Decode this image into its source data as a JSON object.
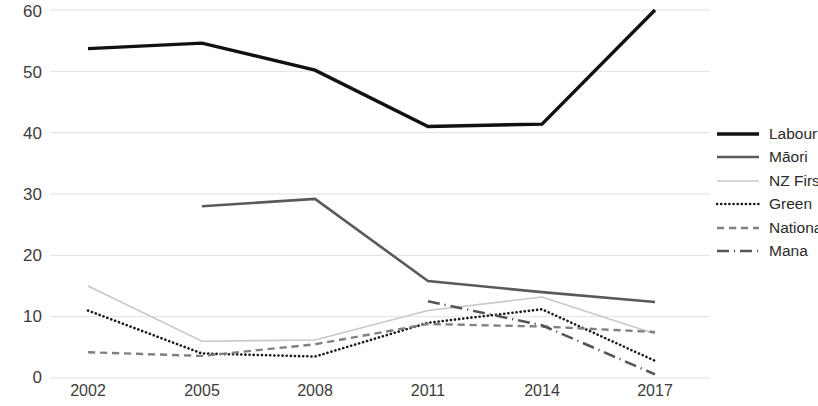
{
  "chart_data": {
    "type": "line",
    "title": "",
    "subtitle": "",
    "xlabel": "",
    "ylabel": "",
    "categories": [
      "2002",
      "2005",
      "2008",
      "2011",
      "2014",
      "2017"
    ],
    "x_tick_labels": [
      "2002",
      "2005",
      "2008",
      "2011",
      "2014",
      "2017"
    ],
    "y_tick_labels": [
      "0",
      "10",
      "20",
      "30",
      "40",
      "50",
      "60"
    ],
    "ylim": [
      0,
      60
    ],
    "xlim": [
      "2002",
      "2017"
    ],
    "grid": "horizontal",
    "legend_position": "right",
    "series": [
      {
        "name": "Labour",
        "style": "solid",
        "color": "#111111",
        "width": 3.4,
        "values": [
          53.7,
          54.6,
          50.2,
          41.0,
          41.4,
          60.0
        ]
      },
      {
        "name": "Māori",
        "style": "solid",
        "color": "#5a5a5a",
        "width": 2.6,
        "values": [
          null,
          28.0,
          29.2,
          15.8,
          14.0,
          12.4
        ]
      },
      {
        "name": "NZ First",
        "style": "solid",
        "color": "#c8c8c8",
        "width": 1.6,
        "values": [
          15.0,
          6.0,
          6.2,
          11.0,
          13.2,
          7.2
        ]
      },
      {
        "name": "Green",
        "style": "dotted",
        "color": "#1a1a1a",
        "width": 2.6,
        "values": [
          11.0,
          4.0,
          3.5,
          9.0,
          11.2,
          2.8
        ]
      },
      {
        "name": "National",
        "style": "dashed",
        "color": "#808080",
        "width": 2.4,
        "values": [
          4.2,
          3.6,
          5.5,
          8.8,
          8.4,
          7.5
        ]
      },
      {
        "name": "Mana",
        "style": "dashdot",
        "color": "#555555",
        "width": 2.6,
        "values": [
          null,
          null,
          null,
          12.5,
          8.6,
          0.6
        ]
      }
    ]
  },
  "legend": {
    "items": [
      {
        "label": "Labour",
        "key": "solid-thick-black"
      },
      {
        "label": "Māori",
        "key": "solid-medium-gray"
      },
      {
        "label": "NZ First",
        "key": "solid-thin-lightgray"
      },
      {
        "label": "Green",
        "key": "dotted-black"
      },
      {
        "label": "National",
        "key": "dashed-gray"
      },
      {
        "label": "Mana",
        "key": "dashdot-gray"
      }
    ]
  },
  "axes": {
    "y_ticks": [
      "60",
      "50",
      "40",
      "30",
      "20",
      "10",
      "0"
    ],
    "x_ticks": [
      "2002",
      "2005",
      "2008",
      "2011",
      "2014",
      "2017"
    ]
  },
  "colors": {
    "background": "#ffffff",
    "gridline": "#e2e2e2",
    "tick_text": "#3c3c3c"
  }
}
